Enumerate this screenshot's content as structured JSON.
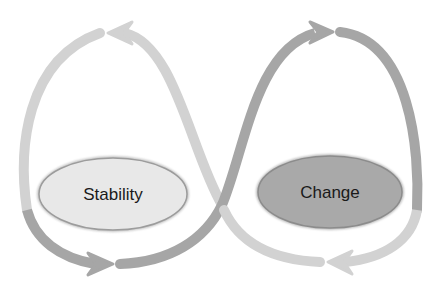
{
  "diagram": {
    "type": "figure-eight cycle",
    "nodes": [
      {
        "id": "stability",
        "label": "Stability",
        "fill": "#e6e6e6",
        "stroke": "#9a9a9a"
      },
      {
        "id": "change",
        "label": "Change",
        "fill": "#a8a8a8",
        "stroke": "#8a8a8a"
      }
    ],
    "colors": {
      "light_arrow": "#d0d0d0",
      "dark_arrow": "#a3a3a3",
      "background": "#ffffff"
    }
  }
}
